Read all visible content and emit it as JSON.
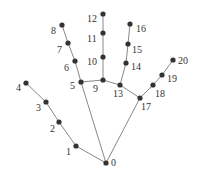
{
  "diagram": {
    "colors": {
      "point": "#333333",
      "edge": "#888888",
      "label": "#333333",
      "background": "#ffffff"
    },
    "points": [
      {
        "id": "0",
        "x": 106,
        "y": 163,
        "lx": 111,
        "ly": 166
      },
      {
        "id": "1",
        "x": 76,
        "y": 146,
        "lx": 66,
        "ly": 155
      },
      {
        "id": "2",
        "x": 59,
        "y": 122,
        "lx": 50,
        "ly": 132
      },
      {
        "id": "3",
        "x": 46,
        "y": 102,
        "lx": 36,
        "ly": 111
      },
      {
        "id": "4",
        "x": 26,
        "y": 83,
        "lx": 16,
        "ly": 91
      },
      {
        "id": "5",
        "x": 81,
        "y": 82,
        "lx": 70,
        "ly": 89
      },
      {
        "id": "6",
        "x": 75,
        "y": 61,
        "lx": 64,
        "ly": 71
      },
      {
        "id": "7",
        "x": 68,
        "y": 43,
        "lx": 57,
        "ly": 53
      },
      {
        "id": "8",
        "x": 62,
        "y": 25,
        "lx": 51,
        "ly": 34
      },
      {
        "id": "9",
        "x": 103,
        "y": 80,
        "lx": 93,
        "ly": 92
      },
      {
        "id": "10",
        "x": 103,
        "y": 57,
        "lx": 87,
        "ly": 65
      },
      {
        "id": "11",
        "x": 103,
        "y": 33,
        "lx": 87,
        "ly": 42
      },
      {
        "id": "12",
        "x": 103,
        "y": 14,
        "lx": 87,
        "ly": 22
      },
      {
        "id": "13",
        "x": 120,
        "y": 85,
        "lx": 113,
        "ly": 97
      },
      {
        "id": "14",
        "x": 126,
        "y": 63,
        "lx": 131,
        "ly": 70
      },
      {
        "id": "15",
        "x": 128,
        "y": 44,
        "lx": 132,
        "ly": 53
      },
      {
        "id": "16",
        "x": 130,
        "y": 24,
        "lx": 136,
        "ly": 32
      },
      {
        "id": "17",
        "x": 140,
        "y": 98,
        "lx": 141,
        "ly": 110
      },
      {
        "id": "18",
        "x": 153,
        "y": 85,
        "lx": 155,
        "ly": 97
      },
      {
        "id": "19",
        "x": 162,
        "y": 75,
        "lx": 167,
        "ly": 82
      },
      {
        "id": "20",
        "x": 173,
        "y": 60,
        "lx": 178,
        "ly": 64
      }
    ],
    "edges": [
      [
        "0",
        "1"
      ],
      [
        "1",
        "2"
      ],
      [
        "2",
        "3"
      ],
      [
        "3",
        "4"
      ],
      [
        "0",
        "5"
      ],
      [
        "5",
        "6"
      ],
      [
        "6",
        "7"
      ],
      [
        "7",
        "8"
      ],
      [
        "5",
        "9"
      ],
      [
        "9",
        "10"
      ],
      [
        "10",
        "11"
      ],
      [
        "11",
        "12"
      ],
      [
        "9",
        "13"
      ],
      [
        "13",
        "14"
      ],
      [
        "14",
        "15"
      ],
      [
        "15",
        "16"
      ],
      [
        "13",
        "17"
      ],
      [
        "0",
        "17"
      ],
      [
        "17",
        "18"
      ],
      [
        "18",
        "19"
      ],
      [
        "19",
        "20"
      ]
    ]
  }
}
